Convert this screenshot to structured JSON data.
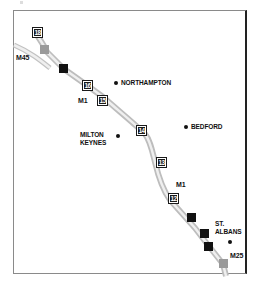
{
  "map": {
    "title": "",
    "colors": {
      "road_casing": "#b9b9b9",
      "road_fill": "#ececec",
      "junction_box": "#1a1a1a",
      "service_square": "#111111",
      "motorway_interchange": "#9a9a9a",
      "text": "#111111"
    },
    "roads": [
      {
        "name": "M1",
        "labels": [
          "M1",
          "M1"
        ]
      },
      {
        "name": "M45",
        "label": "M45"
      },
      {
        "name": "M25",
        "label": "M25"
      }
    ],
    "junctions": [
      {
        "number": "18"
      },
      {
        "number": "16"
      },
      {
        "number": "15"
      },
      {
        "number": "14"
      },
      {
        "number": "13"
      },
      {
        "number": "12"
      }
    ],
    "towns": [
      {
        "name": "NORTHAMPTON"
      },
      {
        "name": "BEDFORD"
      },
      {
        "name_line1": "MILTON",
        "name_line2": "KEYNES"
      },
      {
        "name_line1": "ST.",
        "name_line2": "ALBANS"
      }
    ],
    "markers": [
      {
        "type": "interchange",
        "near": "M45"
      },
      {
        "type": "service-area",
        "near": "junction-17"
      },
      {
        "type": "service-area",
        "near": "junction-11"
      },
      {
        "type": "service-area",
        "near": "junction-10"
      },
      {
        "type": "service-area",
        "near": "junction-9"
      },
      {
        "type": "interchange",
        "near": "M25"
      }
    ]
  }
}
